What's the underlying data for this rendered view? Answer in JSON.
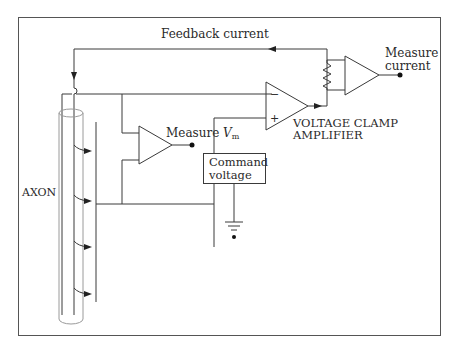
{
  "diagram": {
    "labels": {
      "feedback_current": "Feedback current",
      "measure_current_line1": "Measure",
      "measure_current_line2": "current",
      "measure_vm_prefix": "Measure ",
      "measure_vm_var": "V",
      "measure_vm_sub": "m",
      "clamp_amp_line1": "VOLTAGE CLAMP",
      "clamp_amp_line2": "AMPLIFIER",
      "command_line1": "Command",
      "command_line2": "voltage",
      "axon": "AXON",
      "minus_sign": "−",
      "plus_sign": "+"
    },
    "components": [
      {
        "id": "axon",
        "type": "cylinder",
        "label": "AXON"
      },
      {
        "id": "vm-amplifier",
        "type": "op-amp",
        "label": "Measure Vm"
      },
      {
        "id": "clamp-amplifier",
        "type": "op-amp",
        "label": "VOLTAGE CLAMP AMPLIFIER",
        "inputs": [
          "−",
          "+"
        ]
      },
      {
        "id": "current-amplifier",
        "type": "op-amp",
        "label": "Measure current"
      },
      {
        "id": "feedback-resistor",
        "type": "resistor"
      },
      {
        "id": "command-voltage",
        "type": "box",
        "label": "Command voltage"
      },
      {
        "id": "ground",
        "type": "ground"
      }
    ],
    "colors": {
      "line": "#3a3a3a",
      "axon_outline": "#9a9a9a",
      "frame": "#555555",
      "background": "#ffffff"
    }
  }
}
